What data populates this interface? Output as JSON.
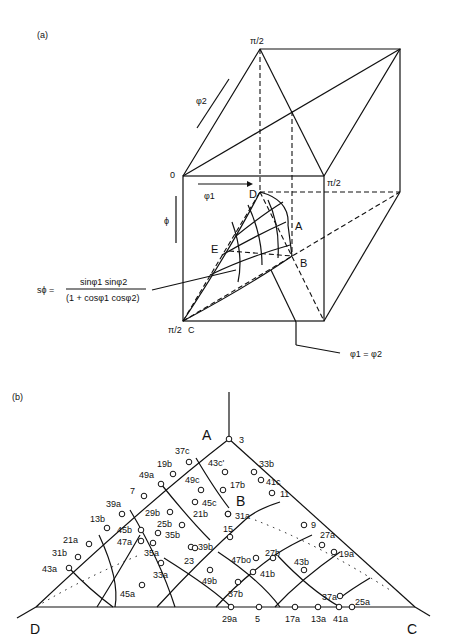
{
  "panel_a": {
    "label": "(a)",
    "top_pi2": "π/2",
    "right_pi2": "π/2",
    "bottom_pi2": "π/2",
    "origin": "0",
    "phi2": "φ2",
    "phi1": "φ1",
    "Phi": "ϕ",
    "D": "D",
    "A": "A",
    "E": "E",
    "B": "B",
    "C": "C",
    "formula_lhs": "sϕ =",
    "formula_num": "sinφ1 sinφ2",
    "formula_den": "(1 + cosφ1 cosφ2)",
    "equal_label": "φ1 = φ2"
  },
  "panel_b": {
    "label": "(b)",
    "vertices": {
      "A": "A",
      "B": "B",
      "C": "C",
      "D": "D"
    },
    "points": [
      {
        "t": "3",
        "x": 229,
        "y": 109,
        "lx": 239,
        "ly": 113
      },
      {
        "t": "37c",
        "x": 189,
        "y": 132,
        "lx": 175,
        "ly": 124
      },
      {
        "t": "19b",
        "x": 173,
        "y": 144,
        "lx": 157,
        "ly": 137
      },
      {
        "t": "49a",
        "x": 161,
        "y": 154,
        "lx": 139,
        "ly": 148
      },
      {
        "t": "7",
        "x": 144,
        "y": 166,
        "lx": 130,
        "ly": 164
      },
      {
        "t": "39a",
        "x": 122,
        "y": 184,
        "lx": 106,
        "ly": 177
      },
      {
        "t": "13b",
        "x": 107,
        "y": 198,
        "lx": 90,
        "ly": 192
      },
      {
        "t": "21a",
        "x": 89,
        "y": 214,
        "lx": 63,
        "ly": 213
      },
      {
        "t": "31b",
        "x": 78,
        "y": 227,
        "lx": 52,
        "ly": 226
      },
      {
        "t": "43a",
        "x": 69,
        "y": 238,
        "lx": 42,
        "ly": 242
      },
      {
        "t": "43c'",
        "x": 225,
        "y": 142,
        "lx": 208,
        "ly": 136
      },
      {
        "t": "49c",
        "x": 201,
        "y": 160,
        "lx": 185,
        "ly": 153
      },
      {
        "t": "17b",
        "x": 223,
        "y": 160,
        "lx": 230,
        "ly": 158
      },
      {
        "t": "45c",
        "x": 195,
        "y": 172,
        "lx": 202,
        "ly": 176
      },
      {
        "t": "29b",
        "x": 170,
        "y": 182,
        "lx": 145,
        "ly": 186
      },
      {
        "t": "21b",
        "x": 228,
        "y": 184,
        "lx": 193,
        "ly": 187
      },
      {
        "t": "31a",
        "x": 228,
        "y": 184,
        "lx": 235,
        "ly": 189
      },
      {
        "t": "25b",
        "x": 182,
        "y": 195,
        "lx": 157,
        "ly": 197
      },
      {
        "t": "45b",
        "x": 141,
        "y": 200,
        "lx": 117,
        "ly": 203
      },
      {
        "t": "35b",
        "x": 158,
        "y": 203,
        "lx": 165,
        "ly": 208
      },
      {
        "t": "15",
        "x": 230,
        "y": 207,
        "lx": 223,
        "ly": 202
      },
      {
        "t": "47a",
        "x": 141,
        "y": 211,
        "lx": 117,
        "ly": 215
      },
      {
        "t": "39b",
        "x": 191,
        "y": 217,
        "lx": 198,
        "ly": 220
      },
      {
        "t": "35a",
        "x": 153,
        "y": 213,
        "lx": 144,
        "ly": 226
      },
      {
        "t": "23",
        "x": 195,
        "y": 218,
        "lx": 184,
        "ly": 234
      },
      {
        "t": "27b",
        "x": 273,
        "y": 228,
        "lx": 265,
        "ly": 226
      },
      {
        "t": "47bo",
        "x": 256,
        "y": 228,
        "lx": 231,
        "ly": 233
      },
      {
        "t": "43b",
        "x": 304,
        "y": 240,
        "lx": 294,
        "ly": 235
      },
      {
        "t": "33a",
        "x": 161,
        "y": 233,
        "lx": 153,
        "ly": 248
      },
      {
        "t": "49b",
        "x": 210,
        "y": 240,
        "lx": 202,
        "ly": 254
      },
      {
        "t": "41b",
        "x": 253,
        "y": 242,
        "lx": 260,
        "ly": 247
      },
      {
        "t": "37b",
        "x": 238,
        "y": 252,
        "lx": 228,
        "ly": 267
      },
      {
        "t": "45a",
        "x": 142,
        "y": 255,
        "lx": 120,
        "ly": 267
      },
      {
        "t": "9",
        "x": 304,
        "y": 195,
        "lx": 311,
        "ly": 198
      },
      {
        "t": "27a",
        "x": 322,
        "y": 215,
        "lx": 320,
        "ly": 208
      },
      {
        "t": "19a",
        "x": 334,
        "y": 222,
        "lx": 339,
        "ly": 227
      },
      {
        "t": "33b",
        "x": 254,
        "y": 142,
        "lx": 259,
        "ly": 137
      },
      {
        "t": "41c",
        "x": 261,
        "y": 150,
        "lx": 266,
        "ly": 155
      },
      {
        "t": "11",
        "x": 272,
        "y": 163,
        "lx": 280,
        "ly": 167
      },
      {
        "t": "37a",
        "x": 340,
        "y": 266,
        "lx": 322,
        "ly": 270
      },
      {
        "t": "25a",
        "x": 352,
        "y": 277,
        "lx": 355,
        "ly": 275
      },
      {
        "t": "29a",
        "x": 231,
        "y": 277,
        "lx": 222,
        "ly": 292
      },
      {
        "t": "5",
        "x": 259,
        "y": 277,
        "lx": 255,
        "ly": 292
      },
      {
        "t": "17a",
        "x": 295,
        "y": 277,
        "lx": 285,
        "ly": 292
      },
      {
        "t": "13a",
        "x": 318,
        "y": 277,
        "lx": 311,
        "ly": 292
      },
      {
        "t": "41a",
        "x": 339,
        "y": 277,
        "lx": 333,
        "ly": 292
      }
    ]
  }
}
